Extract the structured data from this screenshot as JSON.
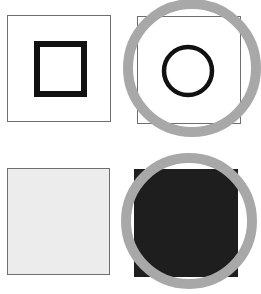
{
  "colors": {
    "background": "#ffffff",
    "frame": "#6e6e6e",
    "symbol": "#111111",
    "ring": "#a8a8a8",
    "light_fill": "#ececec",
    "dark_fill": "#1e1e1e"
  },
  "panels": [
    {
      "id": "square-symbol",
      "symbol": "square-outline",
      "fill": "white",
      "ring": false
    },
    {
      "id": "circle-symbol",
      "symbol": "circle-outline",
      "fill": "white",
      "ring": true
    },
    {
      "id": "light-swatch",
      "symbol": "none",
      "fill": "light-gray",
      "ring": false
    },
    {
      "id": "dark-swatch",
      "symbol": "none",
      "fill": "dark",
      "ring": true
    }
  ]
}
